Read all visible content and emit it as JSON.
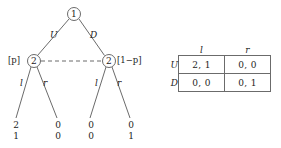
{
  "figure": {
    "type": "game-theory-extensive-form-and-normal-form",
    "tree": {
      "root": {
        "label": "1",
        "player": "1"
      },
      "root_edges": [
        {
          "label": "U",
          "to": "left-node"
        },
        {
          "label": "D",
          "to": "right-node"
        }
      ],
      "info_set": {
        "style": "dashed",
        "nodes": [
          "left-node",
          "right-node"
        ],
        "player": "2"
      },
      "nodes": [
        {
          "id": "left-node",
          "label": "2",
          "prob_label": "[p]",
          "prob_side": "left",
          "edges": [
            {
              "label": "l",
              "payoffs": [
                "2",
                "1"
              ]
            },
            {
              "label": "r",
              "payoffs": [
                "0",
                "0"
              ]
            }
          ]
        },
        {
          "id": "right-node",
          "label": "2",
          "prob_label": "[1−p]",
          "prob_side": "right",
          "edges": [
            {
              "label": "l",
              "payoffs": [
                "0",
                "0"
              ]
            },
            {
              "label": "r",
              "payoffs": [
                "0",
                "1"
              ]
            }
          ]
        }
      ],
      "terminal_payoffs": [
        {
          "top": "2",
          "bottom": "1"
        },
        {
          "top": "0",
          "bottom": "0"
        },
        {
          "top": "0",
          "bottom": "0"
        },
        {
          "top": "0",
          "bottom": "1"
        }
      ]
    },
    "matrix": {
      "col_headers": [
        "l",
        "r"
      ],
      "row_headers": [
        "U",
        "D"
      ],
      "cells": [
        [
          "2, 1",
          "0, 0"
        ],
        [
          "0, 0",
          "0, 1"
        ]
      ]
    },
    "colors": {
      "line": "#6b6b6b",
      "text": "#1d1d1d",
      "background": "#ffffff"
    }
  }
}
